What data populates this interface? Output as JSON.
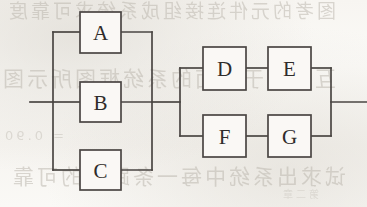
{
  "figure": {
    "kind": "reliability-block-diagram",
    "stroke_color": "#4a4643",
    "label_color": "#2f2c2a",
    "paper_color": "#faf8f5",
    "ghost_text": [
      "图考的元件连接组成系统求可靠度",
      "互，对于下面的系统框图所示图",
      "= 0.90",
      "试求出系统中每一条路径的可靠",
      "第二章"
    ],
    "blocks": [
      {
        "id": "A",
        "label": "A",
        "x": 80,
        "y": 12,
        "w": 41,
        "h": 41,
        "group": "left-parallel"
      },
      {
        "id": "B",
        "label": "B",
        "x": 80,
        "y": 82,
        "w": 41,
        "h": 40,
        "group": "left-parallel"
      },
      {
        "id": "C",
        "label": "C",
        "x": 80,
        "y": 150,
        "w": 41,
        "h": 40,
        "group": "left-parallel"
      },
      {
        "id": "D",
        "label": "D",
        "x": 203,
        "y": 47,
        "w": 43,
        "h": 43,
        "group": "upper-series"
      },
      {
        "id": "E",
        "label": "E",
        "x": 268,
        "y": 47,
        "w": 43,
        "h": 43,
        "group": "upper-series"
      },
      {
        "id": "F",
        "label": "F",
        "x": 203,
        "y": 115,
        "w": 43,
        "h": 42,
        "group": "lower-series"
      },
      {
        "id": "G",
        "label": "G",
        "x": 268,
        "y": 115,
        "w": 43,
        "h": 42,
        "group": "lower-series"
      }
    ],
    "nodes": {
      "input_lead_x": 30,
      "left_bus_x": 53,
      "left_merge_bus_x": 152,
      "right_bus_x": 180,
      "output_bus_x": 331,
      "output_lead_x": 367,
      "main_line_y": 102,
      "branch_a_y": 32,
      "branch_c_y": 170,
      "branch_d_y": 68,
      "branch_f_y": 136
    },
    "connections": [
      {
        "from": "input",
        "to": "left-bus",
        "type": "lead"
      },
      {
        "from": "left-bus",
        "to": "A",
        "type": "parallel-branch"
      },
      {
        "from": "left-bus",
        "to": "B",
        "type": "parallel-branch"
      },
      {
        "from": "left-bus",
        "to": "C",
        "type": "parallel-branch"
      },
      {
        "from": "A",
        "to": "left-merge-bus",
        "type": "parallel-branch"
      },
      {
        "from": "B",
        "to": "left-merge-bus",
        "type": "parallel-branch"
      },
      {
        "from": "C",
        "to": "left-merge-bus",
        "type": "parallel-branch"
      },
      {
        "from": "left-merge-bus",
        "to": "right-bus",
        "type": "link"
      },
      {
        "from": "right-bus",
        "to": "D",
        "type": "parallel-branch"
      },
      {
        "from": "D",
        "to": "E",
        "type": "series"
      },
      {
        "from": "right-bus",
        "to": "F",
        "type": "parallel-branch"
      },
      {
        "from": "F",
        "to": "G",
        "type": "series"
      },
      {
        "from": "E",
        "to": "output-bus",
        "type": "parallel-branch"
      },
      {
        "from": "G",
        "to": "output-bus",
        "type": "parallel-branch"
      },
      {
        "from": "output-bus",
        "to": "output",
        "type": "lead"
      }
    ]
  }
}
